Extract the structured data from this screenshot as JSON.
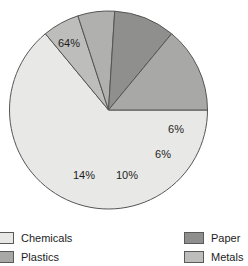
{
  "chart_data": {
    "type": "pie",
    "title": "",
    "labels": [
      "Chemicals",
      "Metals",
      "Paper",
      "Plastics"
    ],
    "slices": [
      {
        "name": "Chemicals",
        "value": 64,
        "data_label": "64%",
        "color": "#e8e8e6",
        "legend": "Chemicals",
        "label_x": 69,
        "label_y": 44
      },
      {
        "name": "Metals",
        "value": 6,
        "data_label": "6%",
        "color": "#bdbdbb",
        "legend": "Metals",
        "label_x": 176,
        "label_y": 130
      },
      {
        "name": "Metals-2",
        "value": 6,
        "data_label": "6%",
        "color": "#b0b0ae",
        "legend": "",
        "label_x": 163,
        "label_y": 155
      },
      {
        "name": "Paper",
        "value": 10,
        "data_label": "10%",
        "color": "#8f8f8d",
        "legend": "Paper",
        "label_x": 127,
        "label_y": 176
      },
      {
        "name": "Plastics",
        "value": 14,
        "data_label": "14%",
        "color": "#a8a8a6",
        "legend": "Plastics",
        "label_x": 84,
        "label_y": 176
      }
    ],
    "start_angle_deg": 0,
    "direction": "clockwise",
    "center": {
      "x": 108.5,
      "y": 110
    },
    "radius": 99,
    "stroke": "#555555",
    "grid": false,
    "legend_position": "bottom",
    "values_sum": 100,
    "xlabel": "",
    "ylabel": ""
  },
  "legend": {
    "left_column": [
      {
        "label": "Chemicals",
        "color": "#e8e8e6"
      },
      {
        "label": "Plastics",
        "color": "#a8a8a6"
      }
    ],
    "right_column": [
      {
        "label": "Paper",
        "color": "#8f8f8d"
      },
      {
        "label": "Metals",
        "color": "#bdbdbb"
      }
    ]
  }
}
